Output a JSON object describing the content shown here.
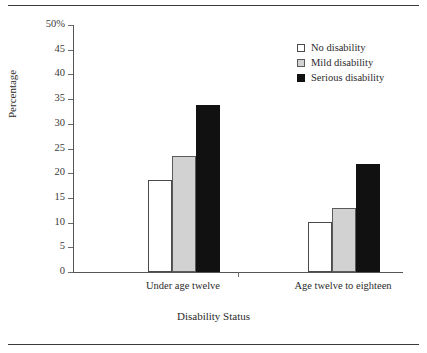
{
  "chart_data": {
    "type": "bar",
    "title": "",
    "xlabel": "Disability Status",
    "ylabel": "Percentage",
    "categories": [
      "Under age twelve",
      "Age twelve to eighteen"
    ],
    "series": [
      {
        "name": "No disability",
        "color": "#ffffff",
        "values": [
          18.7,
          10.2
        ]
      },
      {
        "name": "Mild disability",
        "color": "#d2d2d2",
        "values": [
          23.4,
          12.9
        ]
      },
      {
        "name": "Serious disability",
        "color": "#111111",
        "values": [
          33.8,
          21.8
        ]
      }
    ],
    "ylim": [
      0,
      50
    ],
    "ytick_values": [
      0,
      5,
      10,
      15,
      20,
      25,
      30,
      35,
      40,
      45,
      50
    ],
    "ytick_labels": [
      "0",
      "5",
      "10",
      "15",
      "20",
      "25",
      "30",
      "35",
      "40",
      "45",
      "50%"
    ],
    "grid": false,
    "legend_position": "top-right"
  },
  "axes": {
    "y_title": "Percentage",
    "x_title": "Disability Status",
    "y_ticks": [
      {
        "label": "50%",
        "value": 50
      },
      {
        "label": "45",
        "value": 45
      },
      {
        "label": "40",
        "value": 40
      },
      {
        "label": "35",
        "value": 35
      },
      {
        "label": "30",
        "value": 30
      },
      {
        "label": "25",
        "value": 25
      },
      {
        "label": "20",
        "value": 20
      },
      {
        "label": "15",
        "value": 15
      },
      {
        "label": "10",
        "value": 10
      },
      {
        "label": "5",
        "value": 5
      },
      {
        "label": "0",
        "value": 0
      }
    ],
    "x_categories": [
      {
        "label": "Under age twelve"
      },
      {
        "label": "Age twelve to eighteen"
      }
    ]
  },
  "legend": {
    "items": [
      {
        "label": "No disability",
        "swatch": "white"
      },
      {
        "label": "Mild disability",
        "swatch": "gray"
      },
      {
        "label": "Serious disability",
        "swatch": "black"
      }
    ]
  }
}
